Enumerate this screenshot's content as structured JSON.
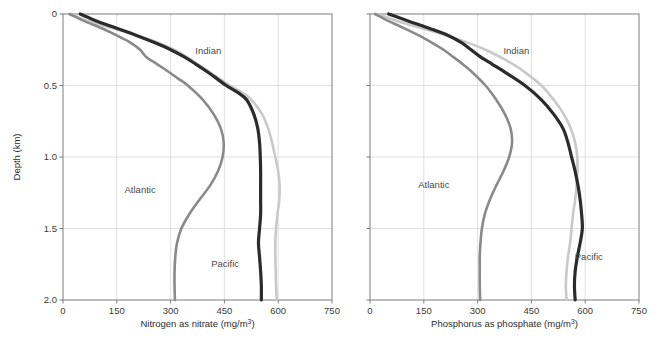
{
  "figure": {
    "background": "#ffffff",
    "panels": [
      {
        "id": "nitrate",
        "name": "nitrogen-panel",
        "xlabel": "Nitrogen as nitrate (mg/m",
        "xlabel_sup": "3",
        "xlabel_tail": ")",
        "xlabel_full": "Nitrogen as nitrate (mg/m³)",
        "ylabel": "Depth (km)",
        "show_ylabel": true
      },
      {
        "id": "phosphate",
        "name": "phosphorus-panel",
        "xlabel": "Phosphorus as phosphate (mg/m",
        "xlabel_sup": "3",
        "xlabel_tail": ")",
        "xlabel_full": "Phosphorus as phosphate (mg/m³)",
        "ylabel": "",
        "show_ylabel": false
      }
    ]
  },
  "chart_data": [
    {
      "type": "line",
      "id": "nitrate",
      "title": "",
      "xlabel": "Nitrogen as nitrate (mg/m³)",
      "ylabel": "Depth (km)",
      "xlim": [
        0,
        750
      ],
      "ylim": [
        0,
        2.0
      ],
      "y_inverted": true,
      "xticks": [
        0,
        150,
        300,
        450,
        600,
        750
      ],
      "xticklabels": [
        "0",
        "150",
        "300",
        "450",
        "600",
        "750"
      ],
      "yticks": [
        0,
        0.5,
        1.0,
        1.5,
        2.0
      ],
      "yticklabels": [
        "0",
        "0.5",
        "1.0",
        "1.5",
        "2.0"
      ],
      "grid": true,
      "legend": "inline-annotations",
      "series": [
        {
          "name": "Indian",
          "color": "#c9c9c9",
          "width": 2.6,
          "label_x": 405,
          "label_depth": 0.28,
          "depth": [
            0.0,
            0.05,
            0.1,
            0.15,
            0.2,
            0.25,
            0.3,
            0.35,
            0.4,
            0.45,
            0.5,
            0.55,
            0.6,
            0.7,
            0.8,
            0.9,
            1.0,
            1.1,
            1.2,
            1.3,
            1.4,
            1.5,
            1.6,
            1.7,
            1.8,
            1.9,
            2.0
          ],
          "values": [
            20,
            70,
            140,
            205,
            265,
            310,
            345,
            375,
            405,
            435,
            465,
            500,
            525,
            555,
            572,
            583,
            592,
            600,
            604,
            603,
            598,
            594,
            592,
            592,
            593,
            594,
            596
          ]
        },
        {
          "name": "Atlantic",
          "color": "#8a8a8a",
          "width": 2.6,
          "label_x": 215,
          "label_depth": 1.25,
          "depth": [
            0.0,
            0.05,
            0.1,
            0.15,
            0.2,
            0.25,
            0.3,
            0.35,
            0.4,
            0.45,
            0.5,
            0.6,
            0.7,
            0.8,
            0.9,
            1.0,
            1.1,
            1.2,
            1.3,
            1.4,
            1.5,
            1.6,
            1.7,
            1.8,
            1.9,
            2.0
          ],
          "values": [
            18,
            60,
            108,
            150,
            188,
            215,
            232,
            262,
            292,
            320,
            348,
            390,
            420,
            440,
            448,
            445,
            432,
            410,
            380,
            352,
            330,
            318,
            313,
            311,
            311,
            312
          ]
        },
        {
          "name": "Pacific",
          "color": "#2b2b2b",
          "width": 3.2,
          "label_x": 452,
          "label_depth": 1.77,
          "depth": [
            0.0,
            0.05,
            0.1,
            0.15,
            0.2,
            0.25,
            0.3,
            0.35,
            0.4,
            0.45,
            0.5,
            0.55,
            0.6,
            0.7,
            0.8,
            0.9,
            1.0,
            1.1,
            1.2,
            1.3,
            1.4,
            1.5,
            1.6,
            1.7,
            1.8,
            1.9,
            2.0
          ],
          "values": [
            48,
            95,
            150,
            205,
            255,
            300,
            338,
            370,
            400,
            428,
            455,
            488,
            512,
            532,
            543,
            548,
            550,
            551,
            551,
            551,
            551,
            548,
            545,
            548,
            551,
            553,
            553
          ]
        }
      ]
    },
    {
      "type": "line",
      "id": "phosphate",
      "title": "",
      "xlabel": "Phosphorus as phosphate (mg/m³)",
      "ylabel": "Depth (km)",
      "xlim": [
        0,
        750
      ],
      "ylim": [
        0,
        2.0
      ],
      "y_inverted": true,
      "xticks": [
        0,
        150,
        300,
        450,
        600,
        750
      ],
      "xticklabels": [
        "0",
        "150",
        "300",
        "450",
        "600",
        "750"
      ],
      "yticks": [
        0,
        0.5,
        1.0,
        1.5,
        2.0
      ],
      "yticklabels": [
        "0",
        "0.5",
        "1.0",
        "1.5",
        "2.0"
      ],
      "grid": true,
      "legend": "inline-annotations",
      "series": [
        {
          "name": "Indian",
          "color": "#c9c9c9",
          "width": 2.6,
          "label_x": 408,
          "label_depth": 0.28,
          "depth": [
            0.0,
            0.05,
            0.1,
            0.15,
            0.2,
            0.25,
            0.3,
            0.35,
            0.4,
            0.5,
            0.6,
            0.7,
            0.8,
            0.9,
            1.0,
            1.1,
            1.2,
            1.3,
            1.4,
            1.5,
            1.6,
            1.7,
            1.8,
            1.9,
            2.0
          ],
          "values": [
            22,
            78,
            145,
            212,
            272,
            322,
            362,
            398,
            428,
            478,
            512,
            540,
            560,
            572,
            578,
            578,
            576,
            572,
            566,
            562,
            558,
            552,
            548,
            546,
            548
          ]
        },
        {
          "name": "Atlantic",
          "color": "#8a8a8a",
          "width": 2.6,
          "label_x": 178,
          "label_depth": 1.22,
          "depth": [
            0.0,
            0.05,
            0.1,
            0.15,
            0.2,
            0.25,
            0.3,
            0.35,
            0.4,
            0.5,
            0.6,
            0.7,
            0.8,
            0.9,
            1.0,
            1.1,
            1.2,
            1.3,
            1.4,
            1.5,
            1.6,
            1.7,
            1.8,
            1.9,
            2.0
          ],
          "values": [
            14,
            52,
            96,
            136,
            172,
            205,
            232,
            258,
            282,
            322,
            352,
            376,
            392,
            396,
            388,
            372,
            352,
            334,
            320,
            312,
            308,
            306,
            306,
            306,
            307
          ]
        },
        {
          "name": "Pacific",
          "color": "#2b2b2b",
          "width": 3.2,
          "label_x": 610,
          "label_depth": 1.72,
          "depth": [
            0.0,
            0.05,
            0.1,
            0.15,
            0.2,
            0.25,
            0.3,
            0.35,
            0.4,
            0.5,
            0.6,
            0.7,
            0.8,
            0.9,
            1.0,
            1.1,
            1.2,
            1.3,
            1.4,
            1.5,
            1.6,
            1.7,
            1.8,
            1.9,
            2.0
          ],
          "values": [
            52,
            108,
            165,
            218,
            255,
            282,
            308,
            340,
            372,
            432,
            478,
            512,
            538,
            552,
            562,
            572,
            580,
            586,
            590,
            592,
            586,
            578,
            572,
            570,
            572
          ]
        }
      ]
    }
  ],
  "colors": {
    "indian": "#c9c9c9",
    "atlantic": "#8a8a8a",
    "pacific": "#2b2b2b",
    "axis": "#7d7d7d",
    "grid": "#d8d8d8",
    "text": "#3c3c3c"
  }
}
